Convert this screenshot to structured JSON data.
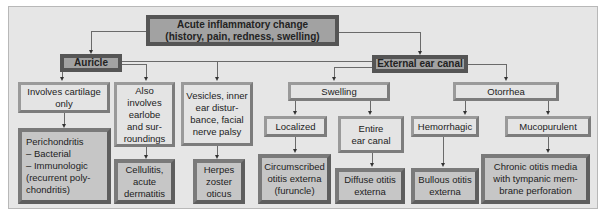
{
  "diagram": {
    "root": {
      "label": "Acute inflammatory change\n(history, pain, redness, swelling)"
    },
    "branches": {
      "auricle": {
        "label": "Auricle",
        "children": [
          {
            "label": "Involves cartilage\nonly",
            "result": "Perichondritis\n– Bacterial\n– Immunologic\n(recurrent poly-\nchondritis)"
          },
          {
            "label": "Also involves\nearlobe\nand sur-\nroundings",
            "result": "Cellulitis,\nacute\ndermatitis"
          },
          {
            "label": "Vesicles, inner\near distur-\nbance, facial\nnerve palsy",
            "result": "Herpes\nzoster\noticus"
          }
        ]
      },
      "external_ear_canal": {
        "label": "External ear canal",
        "children": [
          {
            "label": "Swelling",
            "children": [
              {
                "label": "Localized",
                "result": "Circumscribed\notitis externa\n(furuncle)"
              },
              {
                "label": "Entire\near canal",
                "result": "Diffuse otitis\nexterna"
              }
            ]
          },
          {
            "label": "Otorrhea",
            "children": [
              {
                "label": "Hemorrhagic",
                "result": "Bullous otitis\nexterna"
              },
              {
                "label": "Mucopurulent",
                "result": "Chronic otitis media\nwith tympanic mem-\nbrane perforation"
              }
            ]
          }
        ]
      }
    }
  }
}
